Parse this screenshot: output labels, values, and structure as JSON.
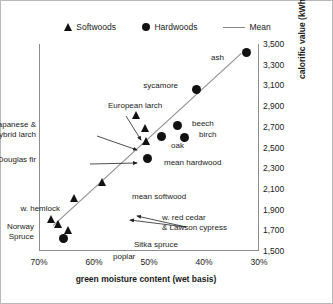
{
  "legend": {
    "items": [
      {
        "label": "Softwoods",
        "marker": "triangle-icon"
      },
      {
        "label": "Hardwoods",
        "marker": "circle-icon"
      },
      {
        "label": "Mean",
        "marker": "line-icon"
      }
    ]
  },
  "chart_data": {
    "type": "scatter",
    "title": "",
    "xlabel": "green moisture content (wet basis)",
    "ylabel": "calorific value (kWh/t)",
    "xlim": [
      70,
      30
    ],
    "ylim": [
      1500,
      3500
    ],
    "x_reversed": true,
    "grid": false,
    "legend_position": "top-center",
    "xticks": [
      "70%",
      "60%",
      "50%",
      "40%",
      "30%"
    ],
    "xtick_values": [
      70,
      60,
      50,
      40,
      30
    ],
    "yticks": [
      "1,500",
      "1,700",
      "1,900",
      "2,100",
      "2,300",
      "2,500",
      "2,700",
      "2,900",
      "3,100",
      "3,300",
      "3,500"
    ],
    "ytick_values": [
      1500,
      1700,
      1900,
      2100,
      2300,
      2500,
      2700,
      2900,
      3100,
      3300,
      3500
    ],
    "series": [
      {
        "name": "Softwoods",
        "marker": "triangle",
        "points": [
          {
            "label": "European larch",
            "x": 52.5,
            "y": 2810
          },
          {
            "label": "Japanese & hybrid larch",
            "x": 50.9,
            "y": 2680
          },
          {
            "label": "Douglas fir",
            "x": 50.7,
            "y": 2560
          },
          {
            "label": "mean softwood",
            "x": 58.7,
            "y": 2160
          },
          {
            "label": "w. hemlock",
            "x": 63.8,
            "y": 2010
          },
          {
            "label": "Norway Spruce",
            "x": 67.9,
            "y": 1800
          },
          {
            "label": "w. red cedar & Lawson cypress",
            "x": 66.6,
            "y": 1760
          },
          {
            "label": "Sitka spruce",
            "x": 64.8,
            "y": 1700
          }
        ]
      },
      {
        "name": "Hardwoods",
        "marker": "circle",
        "points": [
          {
            "label": "ash",
            "x": 32.5,
            "y": 3420
          },
          {
            "label": "sycamore",
            "x": 41.5,
            "y": 3060
          },
          {
            "label": "beech",
            "x": 45.0,
            "y": 2710
          },
          {
            "label": "birch",
            "x": 43.7,
            "y": 2600
          },
          {
            "label": "oak",
            "x": 47.9,
            "y": 2610
          },
          {
            "label": "mean hardwood",
            "x": 50.4,
            "y": 2390
          },
          {
            "label": "poplar",
            "x": 65.8,
            "y": 1620
          }
        ]
      }
    ],
    "mean_line": {
      "name": "Mean",
      "x_start": 67.6,
      "y_start": 1745,
      "x_end": 33.4,
      "y_end": 3410
    }
  },
  "annotations": [
    {
      "text": "ash",
      "anchor": "right"
    },
    {
      "text": "sycamore",
      "anchor": "right"
    },
    {
      "text": "European larch",
      "anchor": "left"
    },
    {
      "text": "Japanese &\nhybrid larch",
      "anchor": "right"
    },
    {
      "text": "Douglas fir",
      "anchor": "right"
    },
    {
      "text": "beech",
      "anchor": "left"
    },
    {
      "text": "birch",
      "anchor": "left"
    },
    {
      "text": "oak",
      "anchor": "left"
    },
    {
      "text": "mean hardwood",
      "anchor": "left"
    },
    {
      "text": "mean softwood",
      "anchor": "left"
    },
    {
      "text": "w. hemlock",
      "anchor": "right"
    },
    {
      "text": "Norway\nSpruce",
      "anchor": "right"
    },
    {
      "text": "w. red cedar\n& Lawson cypress",
      "anchor": "left"
    },
    {
      "text": "Sitka spruce",
      "anchor": "left"
    },
    {
      "text": "poplar",
      "anchor": "left"
    }
  ]
}
